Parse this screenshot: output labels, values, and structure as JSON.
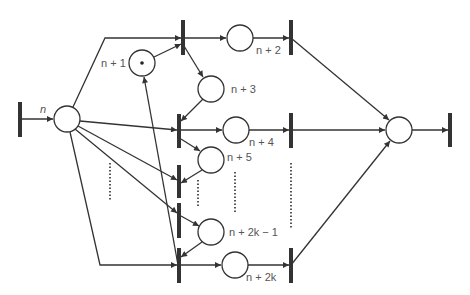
{
  "diagram": {
    "type": "petri-net",
    "colors": {
      "stroke": "#333333",
      "bar": "#333333",
      "text": "#555555",
      "background": "#ffffff"
    },
    "labels": {
      "p_n": "n",
      "p_n1": "n + 1",
      "p_n2": "n + 2",
      "p_n3": "n + 3",
      "p_n4": "n + 4",
      "p_n5": "n + 5",
      "p_n2k1": "n + 2k − 1",
      "p_n2k": "n + 2k"
    },
    "places": [
      {
        "id": "p_n",
        "cx": 67,
        "cy": 119,
        "label": "n"
      },
      {
        "id": "p_n1",
        "cx": 142,
        "cy": 63,
        "label": "n + 1",
        "token": true
      },
      {
        "id": "p_n2",
        "cx": 240,
        "cy": 38,
        "label": "n + 2"
      },
      {
        "id": "p_n3",
        "cx": 211,
        "cy": 89,
        "label": "n + 3"
      },
      {
        "id": "p_n4",
        "cx": 236,
        "cy": 130,
        "label": "n + 4"
      },
      {
        "id": "p_n5",
        "cx": 211,
        "cy": 160,
        "label": "n + 5"
      },
      {
        "id": "p_n2k1",
        "cx": 211,
        "cy": 232,
        "label": "n + 2k − 1"
      },
      {
        "id": "p_n2k",
        "cx": 235,
        "cy": 265,
        "label": "n + 2k"
      },
      {
        "id": "p_out",
        "cx": 399,
        "cy": 130,
        "label": ""
      }
    ],
    "transitions": [
      {
        "id": "t_in",
        "x": 20,
        "y1": 102,
        "y2": 137
      },
      {
        "id": "t1",
        "x": 183,
        "y1": 20,
        "y2": 55
      },
      {
        "id": "t2",
        "x": 291,
        "y1": 20,
        "y2": 55
      },
      {
        "id": "t3",
        "x": 179,
        "y1": 114,
        "y2": 148
      },
      {
        "id": "t4",
        "x": 291,
        "y1": 113,
        "y2": 148
      },
      {
        "id": "t5",
        "x": 179,
        "y1": 165,
        "y2": 198
      },
      {
        "id": "t6",
        "x": 179,
        "y1": 203,
        "y2": 238
      },
      {
        "id": "t7",
        "x": 179,
        "y1": 248,
        "y2": 283
      },
      {
        "id": "t8",
        "x": 291,
        "y1": 248,
        "y2": 283
      },
      {
        "id": "t_out",
        "x": 450,
        "y1": 113,
        "y2": 147
      }
    ],
    "ellipsis_marks": [
      {
        "x": 110,
        "y1": 163,
        "y2": 200
      },
      {
        "x": 198,
        "y1": 180,
        "y2": 208
      },
      {
        "x": 235,
        "y1": 172,
        "y2": 212
      },
      {
        "x": 291,
        "y1": 163,
        "y2": 228
      }
    ]
  }
}
